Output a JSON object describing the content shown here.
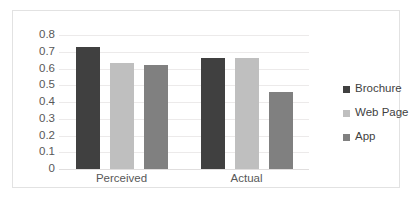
{
  "chart_data": {
    "type": "bar",
    "title": "",
    "xlabel": "",
    "ylabel": "",
    "categories": [
      "Perceived",
      "Actual"
    ],
    "series": [
      {
        "name": "Brochure",
        "color": "#404040",
        "values": [
          0.73,
          0.665
        ]
      },
      {
        "name": "Web Page",
        "color": "#bfbfbf",
        "values": [
          0.63,
          0.665
        ]
      },
      {
        "name": "App",
        "color": "#808080",
        "values": [
          0.62,
          0.46
        ]
      }
    ],
    "ylim": [
      0,
      0.8
    ],
    "ytick_labels": [
      "0.8",
      "0.7",
      "0.6",
      "0.5",
      "0.4",
      "0.3",
      "0.2",
      "0.1",
      "0"
    ],
    "ytick_values": [
      0.8,
      0.7,
      0.6,
      0.5,
      0.4,
      0.3,
      0.2,
      0.1,
      0
    ],
    "grid": true,
    "legend_position": "right"
  },
  "legend": {
    "items": [
      {
        "label": "Brochure",
        "color": "#404040"
      },
      {
        "label": "Web Page",
        "color": "#bfbfbf"
      },
      {
        "label": "App",
        "color": "#808080"
      }
    ]
  },
  "colors": {
    "background": "#ffffff",
    "frame": "#e2e2e2",
    "gridline": "#eceaea",
    "axis_text": "#585858",
    "legend_text": "#3f3f3f"
  }
}
